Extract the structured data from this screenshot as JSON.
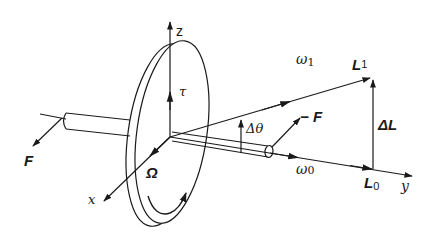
{
  "diagram": {
    "colors": {
      "stroke": "#1a1a1a",
      "background": "#ffffff"
    },
    "labels": {
      "z_axis": "z",
      "x_axis": "x",
      "y_axis": "y",
      "torque": "τ",
      "omega_1": "ω",
      "omega_1_sub": "1",
      "omega_0": "ω",
      "omega_0_sub": "0",
      "delta_theta": "Δθ",
      "force_left": "F",
      "force_right": "− F",
      "precession": "Ω",
      "L1": "L",
      "L1_sub": "1",
      "L0": "L",
      "L0_sub": "0",
      "delta_L": "ΔL"
    },
    "caption_fragment": ""
  }
}
